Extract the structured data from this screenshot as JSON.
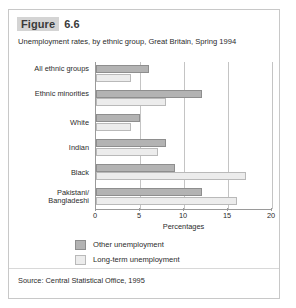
{
  "figure": {
    "label": "Figure",
    "number": "6.6",
    "subtitle": "Unemployment rates, by ethnic group, Great Britain, Spring 1994",
    "source": "Source: Central Statistical Office, 1995"
  },
  "colors": {
    "dark_bar": "#b3b3b3",
    "light_bar": "#ececec",
    "axis": "#9a9a9a",
    "gridline": "#c4c4c4",
    "header_highlight": "#d4d4d4",
    "text": "#2b2b2b"
  },
  "chart_data": {
    "type": "bar",
    "orientation": "horizontal",
    "title": "Unemployment rates, by ethnic group, Great Britain, Spring 1994",
    "xlabel": "Percentages",
    "ylabel": "",
    "xlim": [
      0,
      20
    ],
    "xticks": [
      0,
      5,
      10,
      15,
      20
    ],
    "grid": true,
    "legend_position": "bottom",
    "categories": [
      "All ethnic groups",
      "Ethnic minorities",
      "White",
      "Indian",
      "Black",
      "Pakistani/ Bangladeshi"
    ],
    "series": [
      {
        "name": "Other unemployment",
        "color": "#b3b3b3",
        "values": [
          6,
          12,
          5,
          8,
          9,
          12
        ]
      },
      {
        "name": "Long-term unemployment",
        "color": "#ececec",
        "values": [
          4,
          8,
          4,
          7,
          17,
          16
        ]
      }
    ]
  }
}
